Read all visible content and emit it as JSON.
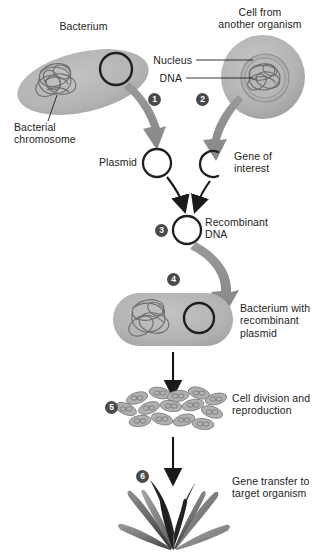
{
  "diagram": {
    "background_color": "#ffffff",
    "cell_fill": "#b5b5b5",
    "arrow_gray": "#8c8c8c",
    "arrow_black": "#1a1a1a",
    "badge_color": "#4a4a4a",
    "text_color": "#1d1d1d"
  },
  "labels": {
    "bacterium": "Bacterium",
    "cell_from_another_organism": "Cell from\nanother organism",
    "nucleus": "Nucleus",
    "dna": "DNA",
    "bacterial_chromosome": "Bacterial\nchromosome",
    "plasmid": "Plasmid",
    "gene_of_interest": "Gene of\ninterest",
    "recombinant_dna": "Recombinant\nDNA",
    "bacterium_with_recombinant_plasmid": "Bacterium with\nrecombinant\nplasmid",
    "cell_division_and_reproduction": "Cell division and\nreproduction",
    "gene_transfer_to_target_organism": "Gene transfer to\ntarget organism"
  },
  "steps": [
    {
      "number": "1",
      "label": "Plasmid isolated from bacterium"
    },
    {
      "number": "2",
      "label": "Gene of interest cut from donor DNA"
    },
    {
      "number": "3",
      "label": "Recombinant DNA formed"
    },
    {
      "number": "4",
      "label": "Recombinant plasmid inserted into bacterium"
    },
    {
      "number": "5",
      "label": "Cell division and reproduction"
    },
    {
      "number": "6",
      "label": "Gene transfer to target organism"
    }
  ]
}
